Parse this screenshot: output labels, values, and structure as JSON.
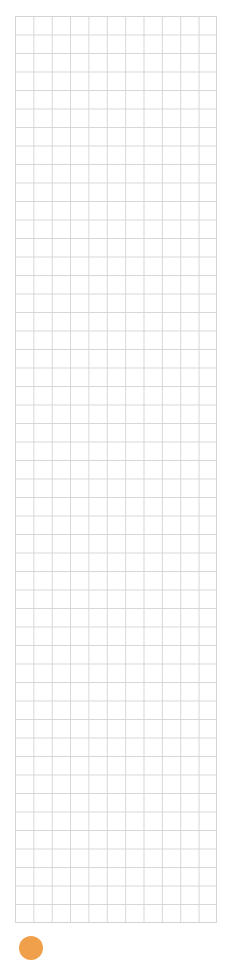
{
  "grid": {
    "columns": 11,
    "rows": 49,
    "line_color": "#d6d6d6"
  },
  "footer": {
    "indicator_icon": "orange-circle-icon",
    "indicator_color": "#f0a04b"
  }
}
